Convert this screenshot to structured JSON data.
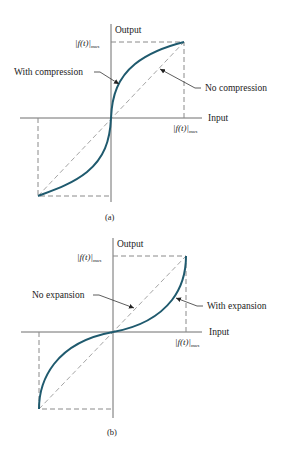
{
  "figure_a": {
    "caption": "(a)",
    "y_axis_label": "Output",
    "x_axis_label": "Input",
    "y_max_label": "|f(t)|",
    "y_max_sub": "max",
    "x_max_label": "|f(t)|",
    "x_max_sub": "max",
    "curve_label": "With compression",
    "diagonal_label": "No compression"
  },
  "figure_b": {
    "caption": "(b)",
    "y_axis_label": "Output",
    "x_axis_label": "Input",
    "y_max_label": "|f(t)|",
    "y_max_sub": "max",
    "x_max_label": "|f(t)|",
    "x_max_sub": "max",
    "curve_label": "With expansion",
    "diagonal_label": "No expansion"
  },
  "colors": {
    "curve": "#1f5a6e",
    "axis": "#6e6e6e"
  }
}
